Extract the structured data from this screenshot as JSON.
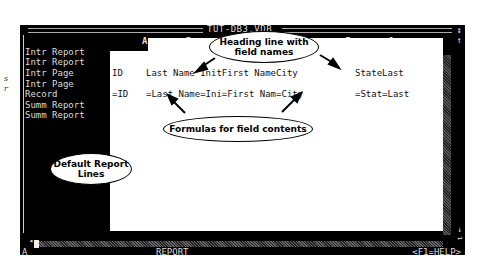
{
  "window": {
    "title": "TUT-DB3.VDB",
    "sizer_icon": "resize-vertical-icon"
  },
  "margin_fragments": [
    "s",
    "r"
  ],
  "column_headers": [
    "A",
    "B",
    "C",
    "F",
    "G"
  ],
  "report_lines": [
    "Intr Report",
    "Intr Report",
    "Intr Page",
    "Intr Page",
    "Record",
    "Summ Report",
    "Summ Report"
  ],
  "heading_row": {
    "a": "ID",
    "b": "Last Name InitFirst NameCity",
    "f": "StateLast"
  },
  "formula_row": {
    "a": "=ID",
    "b": "=Last Name=Ini=First Nam=City",
    "f": "=Stat=Last"
  },
  "status_bar": {
    "cell_indicator": "A",
    "mode": "REPORT",
    "help": "<F1=HELP>"
  },
  "callouts": {
    "heading": "Heading line with field names",
    "formulas": "Formulas for field contents",
    "default_lines": "Default Report Lines"
  },
  "colors": {
    "window_bg": "#000000",
    "workspace_bg": "#ffffff",
    "screen_text": "#dddddd"
  }
}
